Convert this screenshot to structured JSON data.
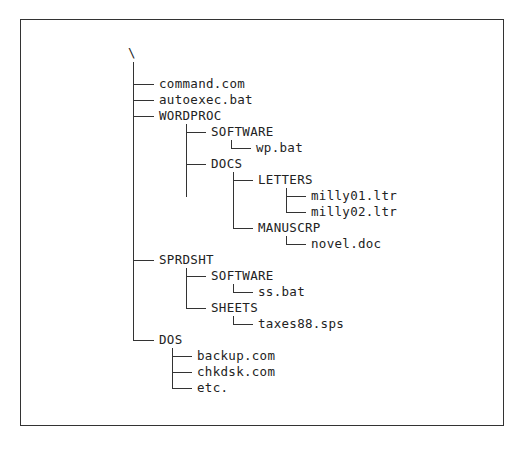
{
  "diagram": {
    "type": "directory-tree",
    "root": "\\",
    "nodes": [
      {
        "id": "command",
        "label": "command.com",
        "depth": 1
      },
      {
        "id": "autoexec",
        "label": "autoexec.bat",
        "depth": 1
      },
      {
        "id": "wordproc",
        "label": "WORDPROC",
        "depth": 1
      },
      {
        "id": "wp_software",
        "label": "SOFTWARE",
        "depth": 2
      },
      {
        "id": "wp_bat",
        "label": "wp.bat",
        "depth": 3
      },
      {
        "id": "docs",
        "label": "DOCS",
        "depth": 2
      },
      {
        "id": "letters",
        "label": "LETTERS",
        "depth": 3
      },
      {
        "id": "milly01",
        "label": "milly01.ltr",
        "depth": 4
      },
      {
        "id": "milly02",
        "label": "milly02.ltr",
        "depth": 4
      },
      {
        "id": "manuscrp",
        "label": "MANUSCRP",
        "depth": 3
      },
      {
        "id": "novel",
        "label": "novel.doc",
        "depth": 4
      },
      {
        "id": "sprdsht",
        "label": "SPRDSHT",
        "depth": 1
      },
      {
        "id": "ss_software",
        "label": "SOFTWARE",
        "depth": 2
      },
      {
        "id": "ss_bat",
        "label": "ss.bat",
        "depth": 3
      },
      {
        "id": "sheets",
        "label": "SHEETS",
        "depth": 2
      },
      {
        "id": "taxes",
        "label": "taxes88.sps",
        "depth": 3
      },
      {
        "id": "dos",
        "label": "DOS",
        "depth": 1
      },
      {
        "id": "backup",
        "label": "backup.com",
        "depth": 2
      },
      {
        "id": "chkdsk",
        "label": "chkdsk.com",
        "depth": 2
      },
      {
        "id": "etc",
        "label": "etc.",
        "depth": 2
      }
    ]
  },
  "labels": {
    "root": "\\",
    "command": "command.com",
    "autoexec": "autoexec.bat",
    "wordproc": "WORDPROC",
    "wp_software": "SOFTWARE",
    "wp_bat": "wp.bat",
    "docs": "DOCS",
    "letters": "LETTERS",
    "milly01": "milly01.ltr",
    "milly02": "milly02.ltr",
    "manuscrp": "MANUSCRP",
    "novel": "novel.doc",
    "sprdsht": "SPRDSHT",
    "ss_software": "SOFTWARE",
    "ss_bat": "ss.bat",
    "sheets": "SHEETS",
    "taxes": "taxes88.sps",
    "dos": "DOS",
    "backup": "backup.com",
    "chkdsk": "chkdsk.com",
    "etc": "etc."
  }
}
